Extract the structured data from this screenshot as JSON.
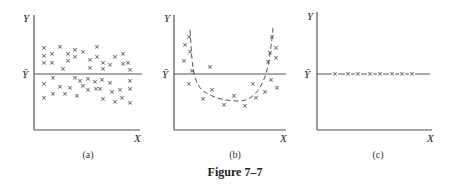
{
  "figure": {
    "title": "Figure 7–7"
  },
  "chart_data": [
    {
      "type": "scatter",
      "panel": "(a)",
      "title": "",
      "xlabel": "X",
      "ylabel": "Y",
      "mean_label": "Ȳ",
      "description": "Random scatter of points evenly distributed above and below the mean line Ȳ",
      "points": [
        [
          44,
          48
        ],
        [
          44,
          56
        ],
        [
          44,
          63
        ],
        [
          52,
          54
        ],
        [
          52,
          63
        ],
        [
          60,
          47
        ],
        [
          63,
          69
        ],
        [
          68,
          54
        ],
        [
          68,
          61
        ],
        [
          75,
          50
        ],
        [
          75,
          57
        ],
        [
          83,
          52
        ],
        [
          90,
          60
        ],
        [
          90,
          68
        ],
        [
          97,
          47
        ],
        [
          97,
          57
        ],
        [
          103,
          69
        ],
        [
          103,
          63
        ],
        [
          110,
          65
        ],
        [
          115,
          57
        ],
        [
          123,
          64
        ],
        [
          123,
          54
        ],
        [
          128,
          63
        ],
        [
          130,
          70
        ],
        [
          44,
          84
        ],
        [
          44,
          98
        ],
        [
          53,
          78
        ],
        [
          53,
          94
        ],
        [
          60,
          87
        ],
        [
          65,
          94
        ],
        [
          70,
          88
        ],
        [
          75,
          78
        ],
        [
          77,
          96
        ],
        [
          80,
          81
        ],
        [
          83,
          86
        ],
        [
          88,
          79
        ],
        [
          88,
          90
        ],
        [
          95,
          82
        ],
        [
          96,
          89
        ],
        [
          100,
          89
        ],
        [
          102,
          80
        ],
        [
          103,
          99
        ],
        [
          110,
          83
        ],
        [
          112,
          92
        ],
        [
          115,
          102
        ],
        [
          120,
          90
        ],
        [
          122,
          98
        ],
        [
          130,
          81
        ],
        [
          130,
          89
        ],
        [
          130,
          103
        ]
      ],
      "mean_y_px": 74
    },
    {
      "type": "scatter",
      "panel": "(b)",
      "title": "",
      "xlabel": "X",
      "ylabel": "Y",
      "mean_label": "Ȳ",
      "description": "Points follow a U-shaped (parabolic) pattern shown by a dashed curve; residuals systematic",
      "points": [
        [
          189,
          37
        ],
        [
          185,
          45
        ],
        [
          190,
          52
        ],
        [
          184,
          61
        ],
        [
          192,
          71
        ],
        [
          210,
          67
        ],
        [
          189,
          84
        ],
        [
          203,
          99
        ],
        [
          212,
          90
        ],
        [
          224,
          105
        ],
        [
          234,
          96
        ],
        [
          245,
          106
        ],
        [
          253,
          84
        ],
        [
          256,
          98
        ],
        [
          265,
          92
        ],
        [
          268,
          62
        ],
        [
          270,
          53
        ],
        [
          272,
          37
        ],
        [
          276,
          48
        ],
        [
          276,
          58
        ],
        [
          271,
          80
        ],
        [
          277,
          88
        ]
      ],
      "curve": "dashed parabola through points, min near x≈235,y≈100",
      "mean_y_px": 74
    },
    {
      "type": "scatter",
      "panel": "(c)",
      "title": "",
      "xlabel": "X",
      "ylabel": "Y",
      "mean_label": "Ȳ",
      "description": "All points lie exactly on the mean line Ȳ",
      "points": [
        [
          335,
          74
        ],
        [
          348,
          74
        ],
        [
          358,
          74
        ],
        [
          370,
          74
        ],
        [
          380,
          74
        ],
        [
          392,
          74
        ],
        [
          402,
          74
        ],
        [
          412,
          74
        ]
      ],
      "mean_y_px": 74
    }
  ]
}
